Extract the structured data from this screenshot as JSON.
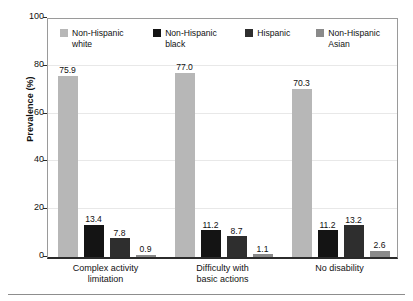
{
  "chart_data": {
    "type": "bar",
    "title": "",
    "xlabel": "",
    "ylabel": "Prevalence (%)",
    "ylim": [
      0,
      100
    ],
    "yticks": [
      0,
      20,
      40,
      60,
      80,
      100
    ],
    "grid": true,
    "legend_position": "top-inside",
    "categories": [
      "Complex activity\nlimitation",
      "Difficulty with\nbasic actions",
      "No disability"
    ],
    "series": [
      {
        "name": "Non-Hispanic white",
        "color": "#b7b7b7",
        "values": [
          75.9,
          77.0,
          70.3
        ],
        "labels": [
          "75.9",
          "77.0",
          "70.3"
        ]
      },
      {
        "name": "Non-Hispanic black",
        "color": "#141414",
        "values": [
          13.4,
          11.2,
          11.2
        ],
        "labels": [
          "13.4",
          "11.2",
          "11.2"
        ]
      },
      {
        "name": "Hispanic",
        "color": "#2e2e2e",
        "values": [
          7.8,
          8.7,
          13.2
        ],
        "labels": [
          "7.8",
          "8.7",
          "13.2"
        ]
      },
      {
        "name": "Non-Hispanic Asian",
        "color": "#8a8a8a",
        "values": [
          0.9,
          1.1,
          2.6
        ],
        "labels": [
          "0.9",
          "1.1",
          "2.6"
        ]
      }
    ]
  },
  "axis": {
    "y_label": "Prevalence (%)",
    "y_ticks": [
      "100",
      "80",
      "60",
      "40",
      "20",
      "0"
    ]
  },
  "legend": {
    "items": [
      {
        "label": "Non-Hispanic\nwhite",
        "color": "#b7b7b7"
      },
      {
        "label": "Non-Hispanic\nblack",
        "color": "#141414"
      },
      {
        "label": "Hispanic",
        "color": "#2e2e2e"
      },
      {
        "label": "Non-Hispanic\nAsian",
        "color": "#8a8a8a"
      }
    ]
  },
  "x_categories": [
    "Complex activity\nlimitation",
    "Difficulty with\nbasic actions",
    "No disability"
  ]
}
